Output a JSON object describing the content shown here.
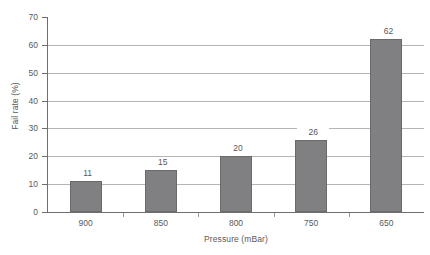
{
  "chart_data": {
    "type": "bar",
    "title": "",
    "subtitle": "",
    "categories": [
      "900",
      "850",
      "800",
      "750",
      "650"
    ],
    "values": [
      11,
      15,
      20,
      26,
      62
    ],
    "data_labels": [
      "11",
      "15",
      "20",
      "26",
      "62"
    ],
    "xlabel": "Pressure (mBar)",
    "ylabel": "Fail rate (%)",
    "ylim": [
      0,
      70
    ],
    "ytick_values": [
      0,
      10,
      20,
      30,
      40,
      50,
      60,
      70
    ],
    "ytick_labels": [
      "0",
      "10",
      "20",
      "30",
      "40",
      "50",
      "60",
      "70"
    ],
    "gridlines": [
      10,
      20,
      30,
      40,
      50,
      60
    ],
    "grid": true,
    "legend": false,
    "legend_position": "none",
    "bar_color": "#808082",
    "bar_edge_color": "#6a6a6c",
    "grid_color": "#8c8c8e",
    "axis_color": "#6f6f71",
    "text_color": "#59595b",
    "background_color": "#ffffff"
  }
}
